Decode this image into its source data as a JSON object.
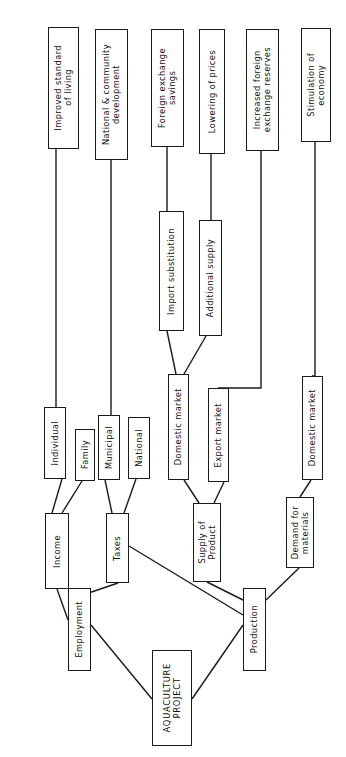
{
  "diagram": {
    "orientation": "rotated-90-text-vertical",
    "style": {
      "box_fill": "#ffffff",
      "box_stroke": "#1a1a1a",
      "line_color": "#1a1a1a",
      "text_color": "#111111",
      "background": "#ffffff"
    },
    "nodes": [
      {
        "id": "improved_standard",
        "label": "Improved standard\nof living",
        "x": 48,
        "y": 27,
        "w": 31,
        "h": 122,
        "thick": false
      },
      {
        "id": "national_community",
        "label": "National & community\ndevelopment",
        "x": 95,
        "y": 29,
        "w": 33,
        "h": 131,
        "thick": true
      },
      {
        "id": "foreign_exchange_sav",
        "label": "Foreign exchange\nsavings",
        "x": 151,
        "y": 29,
        "w": 33,
        "h": 118,
        "thick": false
      },
      {
        "id": "lowering_prices",
        "label": "Lowering of prices",
        "x": 199,
        "y": 29,
        "w": 26,
        "h": 125,
        "thick": true
      },
      {
        "id": "increased_fx_reserves",
        "label": "Increased foreign\nexchange reserves",
        "x": 246,
        "y": 29,
        "w": 33,
        "h": 122,
        "thick": true
      },
      {
        "id": "stimulation_economy",
        "label": "Stimulation of\neconomy",
        "x": 301,
        "y": 28,
        "w": 30,
        "h": 114,
        "thick": false
      },
      {
        "id": "import_substitution",
        "label": "Import substitution",
        "x": 159,
        "y": 211,
        "w": 25,
        "h": 120,
        "thick": true
      },
      {
        "id": "additional_supply",
        "label": "Additional supply",
        "x": 199,
        "y": 220,
        "w": 23,
        "h": 116,
        "thick": true
      },
      {
        "id": "individual",
        "label": "Individual",
        "x": 44,
        "y": 407,
        "w": 22,
        "h": 72,
        "thick": false
      },
      {
        "id": "family",
        "label": "Family",
        "x": 75,
        "y": 429,
        "w": 20,
        "h": 52,
        "thick": false
      },
      {
        "id": "municipal",
        "label": "Municipal",
        "x": 98,
        "y": 415,
        "w": 22,
        "h": 65,
        "thick": true
      },
      {
        "id": "national",
        "label": "National",
        "x": 128,
        "y": 417,
        "w": 22,
        "h": 62,
        "thick": true
      },
      {
        "id": "domestic_market_supply",
        "label": "Domestic market",
        "x": 168,
        "y": 374,
        "w": 21,
        "h": 106,
        "thick": true
      },
      {
        "id": "export_market",
        "label": "Export market",
        "x": 208,
        "y": 388,
        "w": 21,
        "h": 94,
        "thick": true
      },
      {
        "id": "domestic_market_demand",
        "label": "Domestic market",
        "x": 302,
        "y": 376,
        "w": 21,
        "h": 104,
        "thick": true
      },
      {
        "id": "income",
        "label": "Income",
        "x": 45,
        "y": 513,
        "w": 24,
        "h": 76,
        "thick": false
      },
      {
        "id": "taxes",
        "label": "Taxes",
        "x": 106,
        "y": 513,
        "w": 23,
        "h": 70,
        "thick": false
      },
      {
        "id": "supply_of_product",
        "label": "Supply of\nProduct",
        "x": 193,
        "y": 503,
        "w": 28,
        "h": 79,
        "thick": false
      },
      {
        "id": "demand_for_materials",
        "label": "Demand for\nmaterials",
        "x": 286,
        "y": 497,
        "w": 28,
        "h": 71,
        "thick": false
      },
      {
        "id": "employment",
        "label": "Employment",
        "x": 68,
        "y": 588,
        "w": 23,
        "h": 83,
        "thick": false
      },
      {
        "id": "production",
        "label": "Production",
        "x": 243,
        "y": 588,
        "w": 23,
        "h": 83,
        "thick": true
      },
      {
        "id": "aquaculture_project",
        "label": "AQUACULTURE\nPROJECT",
        "x": 152,
        "y": 650,
        "w": 40,
        "h": 96,
        "thick": true,
        "root": true
      }
    ],
    "edges": [
      {
        "from": "aquaculture_project",
        "to": "employment",
        "path": "M152,699 L91,625"
      },
      {
        "from": "aquaculture_project",
        "to": "production",
        "path": "M192,699 L243,625"
      },
      {
        "from": "employment",
        "to": "income",
        "path": "M68,620 L57,589"
      },
      {
        "from": "employment",
        "to": "taxes",
        "path": "M68,600 L118,583"
      },
      {
        "from": "production",
        "to": "taxes",
        "path": "M243,615 L129,546"
      },
      {
        "from": "production",
        "to": "supply_of_product",
        "path": "M243,600 L207,582"
      },
      {
        "from": "production",
        "to": "demand_for_materials",
        "path": "M266,600 L299,568"
      },
      {
        "from": "income",
        "to": "individual",
        "path": "M52,513 L62,479"
      },
      {
        "from": "income",
        "to": "family",
        "path": "M62,513 L82,481"
      },
      {
        "from": "taxes",
        "to": "municipal",
        "path": "M112,513 L105,480"
      },
      {
        "from": "taxes",
        "to": "national",
        "path": "M124,513 L136,479"
      },
      {
        "from": "supply_of_product",
        "to": "domestic_market_supply",
        "path": "M199,503 L184,480"
      },
      {
        "from": "supply_of_product",
        "to": "export_market",
        "path": "M214,503 L224,482"
      },
      {
        "from": "demand_for_materials",
        "to": "domestic_market_demand",
        "path": "M300,497 L311,480"
      },
      {
        "from": "domestic_market_supply",
        "to": "import_substitution",
        "path": "M176,374 L167,331"
      },
      {
        "from": "domestic_market_supply",
        "to": "additional_supply",
        "path": "M184,374 L206,336"
      },
      {
        "from": "import_substitution",
        "to": "foreign_exchange_sav",
        "path": "M167,211 L167,147"
      },
      {
        "from": "additional_supply",
        "to": "lowering_prices",
        "path": "M211,220 L211,154"
      },
      {
        "from": "individual",
        "to": "improved_standard",
        "path": "M56,407 L56,149"
      },
      {
        "from": "family",
        "to": "national_community",
        "path": "M111,429 L111,160"
      },
      {
        "from": "export_market",
        "to": "increased_fx_reserves",
        "path": "M218,388 L261,388 L261,151"
      },
      {
        "from": "domestic_market_demand",
        "to": "stimulation_economy",
        "path": "M312,376 L315,376 L315,142"
      }
    ]
  }
}
